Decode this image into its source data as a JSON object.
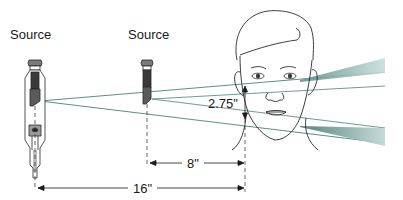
{
  "diagram": {
    "type": "x-ray source-to-face distance diagram",
    "sources": [
      {
        "id": "far-source",
        "label": "Source",
        "x": 35,
        "label_x": 10,
        "label_y": 33
      },
      {
        "id": "near-source",
        "label": "Source",
        "x": 147,
        "label_x": 128,
        "label_y": 33
      }
    ],
    "dimensions": {
      "vertical": {
        "label": "2.75\"",
        "x": 207,
        "y": 98
      },
      "near_distance": {
        "label": "8\"",
        "x": 188,
        "y": 157
      },
      "far_distance": {
        "label": "16\"",
        "x": 134,
        "y": 183
      }
    },
    "colors": {
      "line": "#2a2a2a",
      "beam_edge": "#4d7f7a",
      "beam_fill": "#9fbfbd",
      "tube_dark": "#3a3a3a",
      "tube_mid": "#8a8a8a",
      "background": "#ffffff"
    }
  }
}
